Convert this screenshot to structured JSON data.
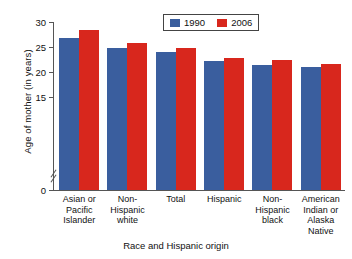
{
  "chart_data": {
    "type": "bar",
    "title": "",
    "xlabel": "Race and Hispanic origin",
    "ylabel": "Age of mother (in years)",
    "categories": [
      "Asian or Pacific Islander",
      "Non-Hispanic white",
      "Total",
      "Hispanic",
      "Non-Hispanic black",
      "American Indian or Alaska Native"
    ],
    "category_lines": [
      [
        "Asian or",
        "Pacific",
        "Islander"
      ],
      [
        "Non-",
        "Hispanic",
        "white"
      ],
      [
        "Total"
      ],
      [
        "Hispanic"
      ],
      [
        "Non-",
        "Hispanic",
        "black"
      ],
      [
        "American",
        "Indian or",
        "Alaska",
        "Native"
      ]
    ],
    "series": [
      {
        "name": "1990",
        "color": "#3a5e9e",
        "values": [
          26.8,
          24.9,
          24.1,
          22.3,
          21.5,
          21.0
        ]
      },
      {
        "name": "2006",
        "color": "#d8271d",
        "values": [
          28.5,
          25.9,
          24.9,
          22.9,
          22.4,
          21.6
        ]
      }
    ],
    "ylim": [
      0,
      30
    ],
    "yticks": [
      0,
      15,
      20,
      25,
      30
    ],
    "ytick_labels": [
      "0",
      "15",
      "20",
      "25",
      "30"
    ],
    "axis_break": true,
    "axis_break_between": [
      0,
      15
    ],
    "grid": false,
    "legend_position": "top-center"
  },
  "legend": {
    "items": [
      {
        "label": "1990",
        "color": "#3a5e9e"
      },
      {
        "label": "2006",
        "color": "#d8271d"
      }
    ]
  },
  "colors": {
    "series_1990": "#3a5e9e",
    "series_2006": "#d8271d",
    "axis": "#555555",
    "text": "#111111",
    "background": "#ffffff"
  }
}
